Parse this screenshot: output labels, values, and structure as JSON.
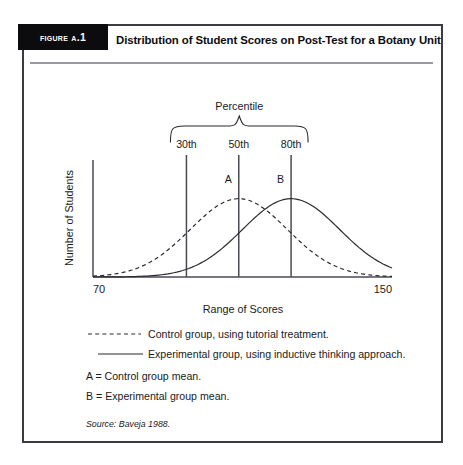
{
  "figure": {
    "tag": "Figure A.1",
    "title": "Distribution of Student Scores on Post-Test for a Botany Unit",
    "source": "Source: Baveja 1988."
  },
  "legend": {
    "dashed_label": "Control group, using tutorial treatment.",
    "solid_label": "Experimental group, using inductive thinking approach.",
    "note_a": "A = Control group mean.",
    "note_b": "B = Experimental group mean."
  },
  "chart_data": {
    "type": "line",
    "title": "Distribution of Student Scores on Post-Test for a Botany Unit",
    "xlabel": "Range of Scores",
    "ylabel": "Number of Students",
    "xlim": [
      70,
      150
    ],
    "ylim": [
      0,
      1
    ],
    "grid": false,
    "legend_position": "below-plot",
    "xtick_labels": [
      "70",
      "150"
    ],
    "xticks": [
      70,
      150
    ],
    "ytick_labels": [],
    "bracket_label": "Percentile",
    "markers": [
      {
        "label": "30th",
        "x": 95,
        "kind": "percentile-line"
      },
      {
        "label": "50th",
        "x": 109,
        "kind": "percentile-line"
      },
      {
        "label": "80th",
        "x": 123,
        "kind": "percentile-line"
      }
    ],
    "annotations": [
      {
        "label": "A",
        "x": 109,
        "meaning": "Control group mean"
      },
      {
        "label": "B",
        "x": 123,
        "meaning": "Experimental group mean"
      }
    ],
    "series": [
      {
        "name": "Control group, using tutorial treatment.",
        "style": "dashed",
        "mean": 109,
        "sd": 13,
        "peak_value": 0.88,
        "x": [
          70,
          74,
          78,
          82,
          86,
          90,
          94,
          98,
          102,
          106,
          109,
          112,
          116,
          120,
          124,
          128,
          132,
          136,
          140,
          144,
          150
        ],
        "y": [
          0.02,
          0.04,
          0.07,
          0.13,
          0.23,
          0.36,
          0.52,
          0.68,
          0.81,
          0.87,
          0.88,
          0.87,
          0.8,
          0.67,
          0.51,
          0.35,
          0.22,
          0.12,
          0.06,
          0.03,
          0.01
        ]
      },
      {
        "name": "Experimental group, using inductive thinking approach.",
        "style": "solid",
        "mean": 123,
        "sd": 13,
        "peak_value": 0.88,
        "x": [
          70,
          76,
          82,
          88,
          92,
          96,
          100,
          104,
          108,
          112,
          116,
          120,
          123,
          126,
          130,
          134,
          138,
          142,
          146,
          150
        ],
        "y": [
          0.0,
          0.0,
          0.01,
          0.03,
          0.06,
          0.12,
          0.22,
          0.37,
          0.55,
          0.72,
          0.84,
          0.88,
          0.88,
          0.86,
          0.77,
          0.6,
          0.4,
          0.22,
          0.09,
          0.02
        ]
      }
    ]
  },
  "axis_labels": {
    "x_left": "70",
    "x_right": "150",
    "x_title": "Range of Scores",
    "y_title": "Number of Students"
  }
}
